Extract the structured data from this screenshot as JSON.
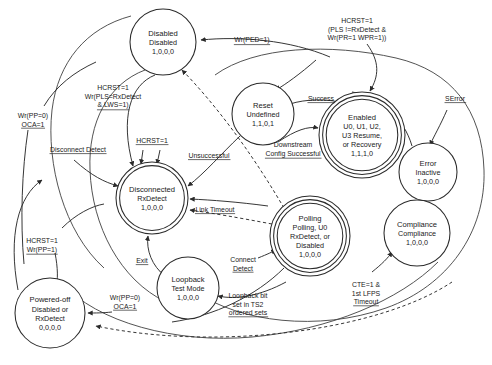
{
  "diagram": {
    "type": "state-machine",
    "states": [
      {
        "id": "disabled",
        "name": "Disabled",
        "sub": [
          "Disabled"
        ],
        "code": "1,0,0,0",
        "cx": 163,
        "cy": 42,
        "r": 33,
        "rings": 1
      },
      {
        "id": "reset",
        "name": "Reset",
        "sub": [
          "Undefined"
        ],
        "code": "1,1,0,1",
        "cx": 263,
        "cy": 114,
        "r": 31,
        "rings": 1
      },
      {
        "id": "enabled",
        "name": "Enabled",
        "sub": [
          "U0, U1, U2,",
          "U3 Resume,",
          "or Recovery"
        ],
        "code": "1,1,1,0",
        "cx": 362,
        "cy": 135,
        "r": 43,
        "rings": 3
      },
      {
        "id": "error",
        "name": "Error",
        "sub": [
          "Inactive"
        ],
        "code": "1,0,0,0",
        "cx": 428,
        "cy": 172,
        "r": 29,
        "rings": 1
      },
      {
        "id": "compliance",
        "name": "Compliance",
        "sub": [
          "Compliance"
        ],
        "code": "1,0,0,0",
        "cx": 417,
        "cy": 233,
        "r": 33,
        "rings": 1
      },
      {
        "id": "polling",
        "name": "Polling",
        "sub": [
          "Polling, U0",
          "RxDetect, or",
          "Disabled"
        ],
        "code": "1,0,0,0",
        "cx": 310,
        "cy": 236,
        "r": 40,
        "rings": 3
      },
      {
        "id": "disconnected",
        "name": "Disconnected",
        "sub": [
          "RxDetect"
        ],
        "code": "1,0,0,0",
        "cx": 152,
        "cy": 198,
        "r": 36,
        "rings": 2
      },
      {
        "id": "loopback",
        "name": "Loopback",
        "sub": [
          "Test Mode"
        ],
        "code": "1,0,0,0",
        "cx": 188,
        "cy": 288,
        "r": 31,
        "rings": 1
      },
      {
        "id": "poweredoff",
        "name": "Powered-off",
        "sub": [
          "Disabled or",
          "RxDetect"
        ],
        "code": "0,0,0,0",
        "cx": 50,
        "cy": 313,
        "r": 35,
        "rings": 1
      }
    ],
    "edge_labels": [
      {
        "id": "wr-ped",
        "lines": [
          "Wr(PED=1)"
        ],
        "x": 252,
        "y": 42,
        "anchor": "middle",
        "underline": true
      },
      {
        "id": "hcrst-pls",
        "lines": [
          "HCRST=1",
          "Wr(PLS=RxDetect",
          "& LWS=1)"
        ],
        "x": 113,
        "y": 90,
        "anchor": "middle",
        "underline": true
      },
      {
        "id": "hcrst-pr-wpr",
        "lines": [
          "HCRST=1",
          "(PLS !=RxDetect &",
          "Wr(PR=1  WPR=1))"
        ],
        "x": 357,
        "y": 23,
        "anchor": "middle",
        "underline": false
      },
      {
        "id": "wr-pp0-oca1-a",
        "lines": [
          "Wr(PP=0)",
          "OCA=1"
        ],
        "x": 33,
        "y": 118,
        "anchor": "middle",
        "underline": true
      },
      {
        "id": "success",
        "lines": [
          "Success"
        ],
        "x": 321,
        "y": 101,
        "anchor": "middle",
        "underline": true
      },
      {
        "id": "serror",
        "lines": [
          "SError"
        ],
        "x": 455,
        "y": 101,
        "anchor": "middle",
        "underline": true
      },
      {
        "id": "disc-detect",
        "lines": [
          "Disconnect Detect"
        ],
        "x": 78,
        "y": 152,
        "anchor": "middle",
        "underline": true
      },
      {
        "id": "hcrst-mid",
        "lines": [
          "HCRST=1"
        ],
        "x": 152,
        "y": 143,
        "anchor": "middle",
        "underline": true
      },
      {
        "id": "unsuccessful",
        "lines": [
          "Unsuccessful"
        ],
        "x": 209,
        "y": 158,
        "anchor": "middle",
        "underline": true
      },
      {
        "id": "down-config",
        "lines": [
          "Downstream",
          "Config Successful"
        ],
        "x": 293,
        "y": 147,
        "anchor": "middle",
        "underline": true
      },
      {
        "id": "link-timeout",
        "lines": [
          "Link Timeout"
        ],
        "x": 215,
        "y": 212,
        "anchor": "middle",
        "underline": true
      },
      {
        "id": "hcrst-wrpp1",
        "lines": [
          "HCRST=1",
          "Wr(PP=1)"
        ],
        "x": 42,
        "y": 243,
        "anchor": "middle",
        "underline": true
      },
      {
        "id": "exit",
        "lines": [
          "Exit"
        ],
        "x": 142,
        "y": 263,
        "anchor": "middle",
        "underline": true
      },
      {
        "id": "connect-det",
        "lines": [
          "Connect",
          "Detect"
        ],
        "x": 243,
        "y": 262,
        "anchor": "middle",
        "underline": true
      },
      {
        "id": "wr-pp0-oca1-b",
        "lines": [
          "Wr(PP=0)",
          "OCA=1"
        ],
        "x": 125,
        "y": 300,
        "anchor": "middle",
        "underline": true
      },
      {
        "id": "loopback-bit",
        "lines": [
          "Loopback bit",
          "set in TS2",
          "ordered sets"
        ],
        "x": 248,
        "y": 298,
        "anchor": "middle",
        "underline": true
      },
      {
        "id": "cte-lfps",
        "lines": [
          "CTE=1 &",
          "1st LFPS",
          "Timeout"
        ],
        "x": 366,
        "y": 287,
        "anchor": "middle",
        "underline": true
      }
    ]
  },
  "colors": {
    "stroke": "#2b2b2b",
    "background": "#ffffff",
    "text": "#1a1a1a"
  }
}
